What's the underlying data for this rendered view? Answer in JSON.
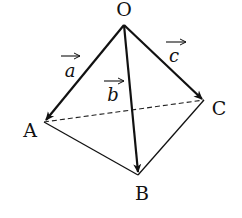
{
  "diagram": {
    "type": "tetrahedron",
    "title": "",
    "vertices": [
      {
        "id": "O",
        "label": "O"
      },
      {
        "id": "A",
        "label": "A"
      },
      {
        "id": "B",
        "label": "B"
      },
      {
        "id": "C",
        "label": "C"
      }
    ],
    "vectors": [
      {
        "id": "a",
        "label": "a",
        "from": "O",
        "to": "A"
      },
      {
        "id": "b",
        "label": "b",
        "from": "O",
        "to": "B"
      },
      {
        "id": "c",
        "label": "c",
        "from": "O",
        "to": "C"
      }
    ],
    "edges": [
      {
        "from": "A",
        "to": "B",
        "style": "solid"
      },
      {
        "from": "B",
        "to": "C",
        "style": "solid"
      },
      {
        "from": "A",
        "to": "C",
        "style": "dashed"
      }
    ],
    "colors": {
      "line": "#111111",
      "background": "#ffffff"
    }
  }
}
